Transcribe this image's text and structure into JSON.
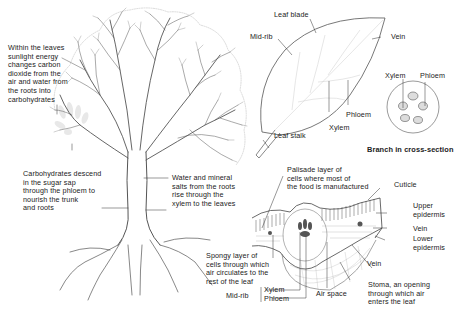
{
  "tree": {
    "leaves_note": "Within the leaves\nsunlight energy\nchanges carbon\ndioxide from the\nair and water from\nthe roots into\ncarbohydrates",
    "phloem_note": "Carbohydrates descend\nin the sugar sap\nthrough the phloem to\nnourish the trunk\nand roots",
    "xylem_note": "Water and mineral\nsalts from the roots\nrise through the\nxylem to the leaves"
  },
  "leaf": {
    "leaf_blade": "Leaf blade",
    "mid_rib": "Mid-rib",
    "vein": "Vein",
    "phloem": "Phloem",
    "xylem": "Xylem",
    "leaf_stalk": "Leaf stalk"
  },
  "branch": {
    "xylem": "Xylem",
    "phloem": "Phloem",
    "caption": "Branch in cross-section"
  },
  "cross_section": {
    "palisade": "Palisade layer of\ncells where most of\nthe food is manufactured",
    "cuticle": "Cuticle",
    "upper_epidermis": "Upper\nepidermis",
    "vein_right": "Vein",
    "lower_epidermis": "Lower\nepidermis",
    "vein_bottom": "Vein",
    "spongy": "Spongy layer of\ncells through which\nair circulates to the\nrest of the leaf",
    "mid_rib": "Mid-rib",
    "xylem": "Xylem",
    "phloem": "Phloem",
    "air_space": "Air space",
    "stoma": "Stoma, an opening\nthrough which air\nenters the leaf"
  },
  "colors": {
    "ink": "#222222",
    "line": "#555555",
    "faint": "#bbbbbb",
    "leaf_ghost": "#e6e6e6"
  }
}
